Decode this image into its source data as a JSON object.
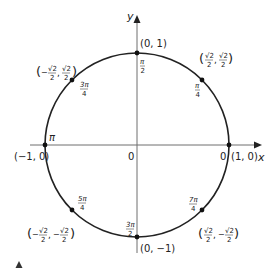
{
  "diagram": {
    "axes": {
      "x_label": "x",
      "y_label": "y",
      "origin_label": "0"
    },
    "colors": {
      "ink": "#222222",
      "axis": "#6e6e6e",
      "background": "#ffffff"
    },
    "points": [
      {
        "id": "p0",
        "angle": "0",
        "coord": "(1, 0)"
      },
      {
        "id": "p45",
        "angle": "π/4",
        "angle_num": "π",
        "angle_den": "4",
        "coord_x_num": "√2",
        "coord_x_den": "2",
        "coord_y_num": "√2",
        "coord_y_den": "2",
        "x_sign": "",
        "y_sign": ""
      },
      {
        "id": "p90",
        "angle": "π/2",
        "angle_num": "π",
        "angle_den": "2",
        "coord": "(0, 1)"
      },
      {
        "id": "p135",
        "angle": "3π/4",
        "angle_num": "3π",
        "angle_den": "4",
        "coord_x_num": "√2",
        "coord_x_den": "2",
        "coord_y_num": "√2",
        "coord_y_den": "2",
        "x_sign": "−",
        "y_sign": ""
      },
      {
        "id": "p180",
        "angle": "π",
        "coord": "(−1, 0)"
      },
      {
        "id": "p225",
        "angle": "5π/4",
        "angle_num": "5π",
        "angle_den": "4",
        "coord_x_num": "√2",
        "coord_x_den": "2",
        "coord_y_num": "√2",
        "coord_y_den": "2",
        "x_sign": "−",
        "y_sign": "−"
      },
      {
        "id": "p270",
        "angle": "3π/2",
        "angle_num": "3π",
        "angle_den": "2",
        "coord": "(0, −1)"
      },
      {
        "id": "p315",
        "angle": "7π/4",
        "angle_num": "7π",
        "angle_den": "4",
        "coord_x_num": "√2",
        "coord_x_den": "2",
        "coord_y_num": "√2",
        "coord_y_den": "2",
        "x_sign": "",
        "y_sign": "−"
      }
    ],
    "labels": {
      "zero_right": "0",
      "pi_left": "π",
      "paren_open": "(",
      "paren_close": ")",
      "comma": ","
    }
  }
}
